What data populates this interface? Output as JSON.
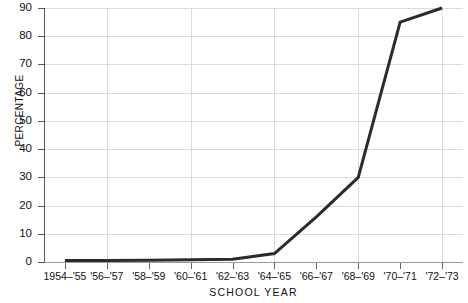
{
  "chart_data": {
    "type": "line",
    "title": "",
    "xlabel": "SCHOOL  YEAR",
    "ylabel": "PERCENTAGE",
    "categories": [
      "1954–'55",
      "'56–'57",
      "'58–'59",
      "'60–'61",
      "'62–'63",
      "'64–'65",
      "'66–'67",
      "'68–'69",
      "'70–'71",
      "'72–'73"
    ],
    "values": [
      0.5,
      0.5,
      0.6,
      0.8,
      1.0,
      3.0,
      16.0,
      30.0,
      85.0,
      90.0
    ],
    "series": [
      {
        "name": "percentage",
        "values": [
          0.5,
          0.5,
          0.6,
          0.8,
          1.0,
          3.0,
          16.0,
          30.0,
          85.0,
          90.0
        ]
      }
    ],
    "ylim": [
      0,
      90
    ],
    "yticks": [
      0,
      10,
      20,
      30,
      40,
      50,
      60,
      70,
      80,
      90
    ],
    "ytick_labels": [
      "0",
      "10",
      "20",
      "30",
      "40",
      "50",
      "60",
      "70",
      "80",
      "90"
    ],
    "grid": "both",
    "grid_color": "#dcdcdc",
    "line_color": "#2b2b2b",
    "line_width": 3,
    "background": "#ffffff",
    "legend": "none"
  }
}
